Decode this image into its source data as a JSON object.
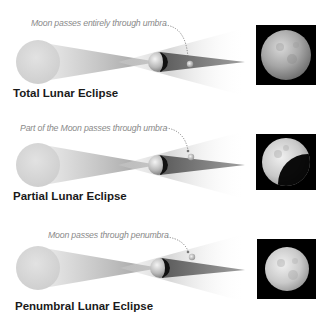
{
  "figure": {
    "panels": [
      {
        "id": "total",
        "title": "Total Lunar Eclipse",
        "caption": "Moon passes entirely through umbra",
        "moon_position": "umbra",
        "photo_phase": "full-dim"
      },
      {
        "id": "partial",
        "title": "Partial Lunar Eclipse",
        "caption": "Part of the Moon passes through umbra",
        "moon_position": "umbra-edge",
        "photo_phase": "partial"
      },
      {
        "id": "penumbral",
        "title": "Penumbral Lunar Eclipse",
        "caption": "Moon passes through penumbra",
        "moon_position": "penumbra",
        "photo_phase": "full-bright"
      }
    ],
    "icons": {
      "sun": "sun-sphere-icon",
      "earth": "earth-sphere-icon",
      "moon": "moon-sphere-icon",
      "photo": "moon-photo"
    },
    "colors": {
      "sun": "#d6d6d6",
      "umbra": "#8c8c8c",
      "penumbra": "#e2e2e2",
      "earth_dark": "#111111",
      "caption": "#8a8a8a",
      "title": "#1a1a1a",
      "photo_bg": "#000000"
    }
  }
}
